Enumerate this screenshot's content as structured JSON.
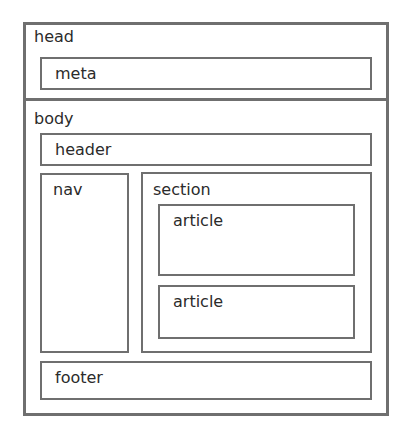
{
  "diagram": {
    "head": {
      "label": "head",
      "children": [
        {
          "label": "meta"
        }
      ]
    },
    "body": {
      "label": "body",
      "header": {
        "label": "header"
      },
      "nav": {
        "label": "nav"
      },
      "section": {
        "label": "section",
        "articles": [
          {
            "label": "article"
          },
          {
            "label": "article"
          }
        ]
      },
      "footer": {
        "label": "footer"
      }
    },
    "colors": {
      "border": "#6f6f6f",
      "text": "#2b2b2b",
      "background": "#ffffff"
    }
  }
}
